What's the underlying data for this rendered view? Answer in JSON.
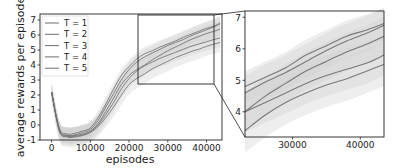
{
  "chart_data": [
    {
      "type": "line",
      "title": "",
      "xlabel": "episodes",
      "ylabel": "average rewards per episode",
      "xlim": [
        -3000,
        44000
      ],
      "ylim": [
        -1,
        7.4
      ],
      "xticks": [
        "0",
        "10000",
        "20000",
        "30000",
        "40000"
      ],
      "yticks": [
        "-1",
        "0",
        "1",
        "2",
        "3",
        "4",
        "5",
        "6",
        "7"
      ],
      "grid": false,
      "legend_position": "upper left",
      "legend": [
        "T = 1",
        "T = 2",
        "T = 3",
        "T = 4",
        "T = 5"
      ],
      "x": [
        0,
        2000,
        4000,
        6000,
        8000,
        10000,
        12000,
        14000,
        16000,
        18000,
        20000,
        22000,
        24000,
        26000,
        28000,
        30000,
        32000,
        34000,
        36000,
        38000,
        40000,
        42000,
        43500
      ],
      "series": [
        {
          "name": "T = 1",
          "values": [
            2.2,
            -0.2,
            -0.6,
            -0.55,
            -0.4,
            -0.2,
            0.5,
            1.4,
            2.4,
            3.3,
            3.9,
            4.4,
            4.75,
            4.95,
            5.2,
            5.4,
            5.6,
            5.85,
            6.05,
            6.25,
            6.45,
            6.6,
            6.8
          ]
        },
        {
          "name": "T = 2",
          "values": [
            2.2,
            -0.3,
            -0.7,
            -0.65,
            -0.5,
            -0.3,
            0.3,
            1.2,
            2.1,
            3.0,
            3.7,
            4.2,
            4.55,
            4.8,
            5.05,
            5.3,
            5.5,
            5.7,
            5.95,
            6.15,
            6.35,
            6.55,
            6.75
          ]
        },
        {
          "name": "T = 3",
          "values": [
            2.2,
            -0.3,
            -0.7,
            -0.7,
            -0.6,
            -0.4,
            0.1,
            0.9,
            1.8,
            2.7,
            3.3,
            3.7,
            4.0,
            4.35,
            4.65,
            4.95,
            5.2,
            5.45,
            5.7,
            5.9,
            6.1,
            6.25,
            6.4
          ]
        },
        {
          "name": "T = 4",
          "values": [
            2.2,
            -0.4,
            -0.75,
            -0.75,
            -0.65,
            -0.45,
            0.0,
            0.7,
            1.5,
            2.4,
            3.1,
            3.6,
            3.95,
            4.2,
            4.45,
            4.65,
            4.85,
            5.05,
            5.25,
            5.4,
            5.55,
            5.7,
            5.8
          ]
        },
        {
          "name": "T = 5",
          "values": [
            2.2,
            -0.4,
            -0.8,
            -0.8,
            -0.7,
            -0.5,
            -0.1,
            0.5,
            1.2,
            2.0,
            2.7,
            3.1,
            3.4,
            3.75,
            4.0,
            4.25,
            4.5,
            4.7,
            4.9,
            5.05,
            5.25,
            5.4,
            5.5
          ]
        }
      ],
      "shaded_band": "std deviation envelope per series (light gray)"
    },
    {
      "type": "line",
      "title": "zoomed inset",
      "xlabel": "",
      "ylabel": "",
      "xlim": [
        23000,
        43500
      ],
      "ylim": [
        3.2,
        7.2
      ],
      "xticks": [
        "30000",
        "40000"
      ],
      "yticks": [
        "4",
        "5",
        "6",
        "7"
      ],
      "grid": false,
      "x": [
        23000,
        26000,
        29000,
        32000,
        35000,
        38000,
        41000,
        43500
      ],
      "series": [
        {
          "name": "T = 1",
          "values": [
            4.8,
            5.1,
            5.4,
            5.8,
            6.1,
            6.4,
            6.6,
            6.8
          ]
        },
        {
          "name": "T = 2",
          "values": [
            4.6,
            4.95,
            5.25,
            5.6,
            5.95,
            6.25,
            6.5,
            6.75
          ]
        },
        {
          "name": "T = 3",
          "values": [
            4.0,
            4.5,
            4.9,
            5.3,
            5.6,
            5.9,
            6.15,
            6.4
          ]
        },
        {
          "name": "T = 4",
          "values": [
            4.0,
            4.3,
            4.6,
            4.9,
            5.15,
            5.35,
            5.55,
            5.8
          ]
        },
        {
          "name": "T = 5",
          "values": [
            3.4,
            3.9,
            4.3,
            4.6,
            4.85,
            5.05,
            5.3,
            5.5
          ]
        }
      ]
    }
  ],
  "colors": {
    "line": "#6e6e6e",
    "band": "#cfcfcf",
    "axis": "#222222"
  }
}
